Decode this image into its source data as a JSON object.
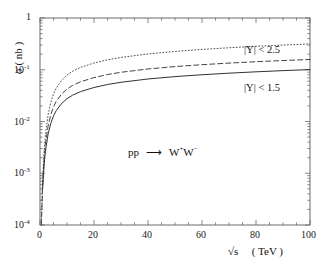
{
  "chart_data": {
    "type": "line",
    "title": "",
    "subtitle": "",
    "xlabel": "√s  ( TeV )",
    "ylabel": "σ  ( nb )",
    "xlim": [
      0,
      100
    ],
    "ylim": [
      0.0001,
      1
    ],
    "yscale": "log",
    "xscale": "linear",
    "grid": false,
    "legend_position": "inline-right",
    "xticks": [
      0,
      20,
      40,
      60,
      80,
      100
    ],
    "xticklabels": [
      "0",
      "20",
      "40",
      "60",
      "80",
      "100"
    ],
    "yticks": [
      1,
      0.1,
      0.01,
      0.001,
      0.0001
    ],
    "yticklabels": [
      "1",
      "10⁻¹",
      "10⁻²",
      "10⁻³",
      "10⁻⁴"
    ],
    "minor_ticks": true,
    "x": [
      0.5,
      1,
      1.5,
      2,
      3,
      4,
      5,
      6,
      8,
      10,
      12,
      15,
      20,
      25,
      30,
      40,
      50,
      60,
      70,
      80,
      90,
      100
    ],
    "series": [
      {
        "name": "|Y| < 2.5",
        "linestyle": "dotted",
        "color": "#555555",
        "label": "|Y| < 2.5",
        "values": [
          0.00011,
          0.0008,
          0.0026,
          0.0055,
          0.0135,
          0.0235,
          0.034,
          0.044,
          0.0625,
          0.079,
          0.093,
          0.111,
          0.135,
          0.156,
          0.173,
          0.202,
          0.226,
          0.247,
          0.266,
          0.284,
          0.3,
          0.315
        ]
      },
      {
        "name": "middle",
        "linestyle": "dashed",
        "color": "#444444",
        "label": "",
        "values": [
          0.0001,
          0.00062,
          0.0018,
          0.0036,
          0.0082,
          0.0136,
          0.0192,
          0.0245,
          0.034,
          0.0424,
          0.0495,
          0.0585,
          0.0705,
          0.0808,
          0.0893,
          0.1035,
          0.1152,
          0.1253,
          0.1345,
          0.143,
          0.1508,
          0.158
        ]
      },
      {
        "name": "|Y| < 1.5",
        "linestyle": "solid",
        "color": "#333333",
        "label": "|Y| < 1.5",
        "values": [
          9.8e-05,
          0.00052,
          0.0014,
          0.00265,
          0.0057,
          0.0092,
          0.0128,
          0.0162,
          0.0223,
          0.0276,
          0.0321,
          0.0378,
          0.0454,
          0.0519,
          0.0573,
          0.0663,
          0.0737,
          0.0801,
          0.0859,
          0.0912,
          0.0961,
          0.1007
        ]
      }
    ],
    "annotations": [
      {
        "name": "reaction",
        "text_parts": [
          "pp",
          "⟶",
          "W",
          "+",
          "W",
          "−"
        ],
        "x": 40,
        "y": 0.0045
      }
    ]
  },
  "axes": {
    "y_label_sigma": "σ",
    "y_label_unit": "( nb )",
    "x_label_root": "√s",
    "x_label_unit": "( TeV )"
  },
  "curve_labels": {
    "upper": "|Y| < 2.5",
    "lower": "|Y| < 1.5"
  },
  "reaction": {
    "initial": "pp",
    "arrow": "⟶",
    "w_plus_base": "W",
    "w_plus_sup": "+",
    "w_minus_base": "W",
    "w_minus_sup": "−"
  },
  "yticklabels": {
    "t0_base": "1",
    "t1_base": "10",
    "t1_sup": "-1",
    "t2_base": "10",
    "t2_sup": "-2",
    "t3_base": "10",
    "t3_sup": "-3",
    "t4_base": "10",
    "t4_sup": "-4"
  },
  "xticklabels": {
    "t0": "0",
    "t1": "20",
    "t2": "40",
    "t3": "60",
    "t4": "80",
    "t5": "100"
  }
}
